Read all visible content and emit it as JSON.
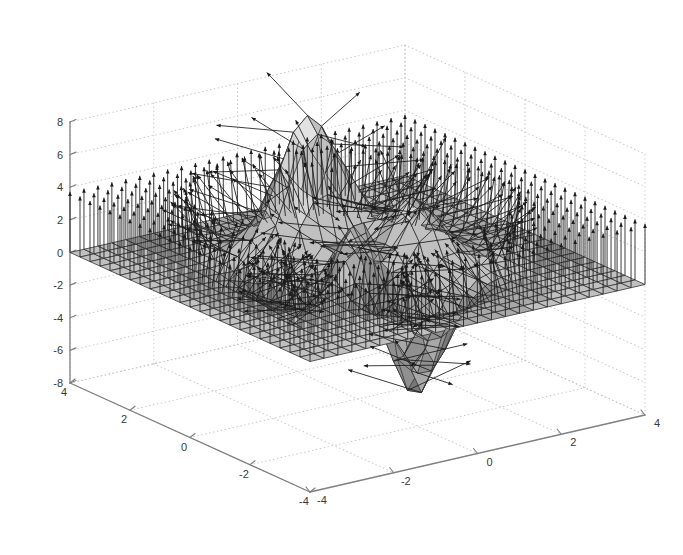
{
  "figure": {
    "title": "",
    "background_color": "#ffffff",
    "width": 683,
    "height": 555
  },
  "chart_data": {
    "type": "surface",
    "render_style": "surfnorm",
    "title": "",
    "subtitle": "",
    "xlabel": "",
    "ylabel": "",
    "zlabel": "",
    "function": "peaks",
    "grid": true,
    "grid_style": "dotted",
    "grid_color": "#c8c8c8",
    "box": false,
    "legend": null,
    "colormap": "gray",
    "shading": "faceted",
    "face_colors": [
      "#4a4a4a",
      "#606060",
      "#787878",
      "#909090",
      "#a8a8a8",
      "#c0c0c0",
      "#d4d4d4",
      "#e2e2e2"
    ],
    "mesh_edge_color": "#333333",
    "normal_vector_color": "#1a1a1a",
    "axes_color": "#808080",
    "view": {
      "azimuth": -37.5,
      "elevation": 30
    },
    "mesh": {
      "nx": 25,
      "ny": 25,
      "x_step": 0.3333,
      "y_step": 0.3333
    },
    "xaxis": {
      "label": "",
      "min": -4,
      "max": 4,
      "ticks": [
        -4,
        -2,
        0,
        2,
        4
      ],
      "ticklabels": [
        "-4",
        "-2",
        "0",
        "2",
        "4"
      ],
      "direction": "right-front-to-back-right"
    },
    "yaxis": {
      "label": "",
      "min": -4,
      "max": 4,
      "ticks": [
        4,
        2,
        0,
        -2,
        -4
      ],
      "ticklabels": [
        "4",
        "2",
        "0",
        "-2",
        "-4"
      ],
      "direction": "left-back-to-front"
    },
    "zaxis": {
      "label": "",
      "min": -8,
      "max": 8,
      "ticks": [
        8,
        6,
        4,
        2,
        0,
        -2,
        -4,
        -6,
        -8
      ],
      "ticklabels": [
        "8",
        "6",
        "4",
        "2",
        "0",
        "-2",
        "-4",
        "-6",
        "-8"
      ]
    },
    "zlim": [
      -8,
      8
    ],
    "features": [
      {
        "name": "primary-peak",
        "x": -0.01,
        "y": 1.58,
        "z": 8.08
      },
      {
        "name": "secondary-peak",
        "x": 1.3,
        "y": -0.01,
        "z": 3.78
      },
      {
        "name": "deep-valley",
        "x": 0.23,
        "y": -1.63,
        "z": -6.55
      },
      {
        "name": "shallow-dip",
        "x": -1.35,
        "y": -0.2,
        "z": -3.05
      }
    ]
  },
  "axis_labels": {
    "z": [
      "8",
      "6",
      "4",
      "2",
      "0",
      "-2",
      "-4",
      "-6",
      "-8"
    ],
    "y": [
      "4",
      "2",
      "0",
      "-2",
      "-4"
    ],
    "x": [
      "-4",
      "-2",
      "0",
      "2",
      "4"
    ]
  }
}
